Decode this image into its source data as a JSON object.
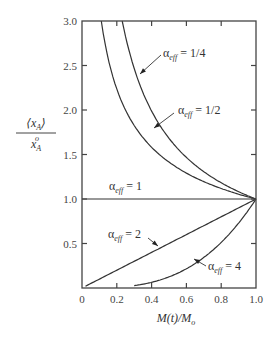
{
  "chart_data": {
    "type": "line",
    "title": "",
    "xlabel": "M(t)/M₀",
    "ylabel": "⟨x_A⟩ / x_A°",
    "xlim": [
      0,
      1.0
    ],
    "ylim": [
      0,
      3.0
    ],
    "grid": false,
    "legend": "inline annotations with arrows",
    "x_ticks": [
      "0",
      "0.2",
      "0.4",
      "0.6",
      "0.8",
      "1.0"
    ],
    "y_ticks": [
      "0.5",
      "1.0",
      "1.5",
      "2.0",
      "2.5",
      "3.0"
    ],
    "formula": "y = x^(alpha_eff - 1)",
    "series": [
      {
        "name": "α_eff = 1/4",
        "alpha": 0.25,
        "x": [
          0.231,
          0.3,
          0.4,
          0.5,
          0.6,
          0.7,
          0.8,
          0.9,
          1.0
        ],
        "y": [
          3.0,
          2.47,
          1.99,
          1.68,
          1.47,
          1.31,
          1.18,
          1.08,
          1.0
        ]
      },
      {
        "name": "α_eff = 1/2",
        "alpha": 0.5,
        "x": [
          0.111,
          0.2,
          0.3,
          0.4,
          0.5,
          0.6,
          0.7,
          0.8,
          0.9,
          1.0
        ],
        "y": [
          3.0,
          2.24,
          1.83,
          1.58,
          1.41,
          1.29,
          1.2,
          1.12,
          1.05,
          1.0
        ]
      },
      {
        "name": "α_eff = 1",
        "alpha": 1,
        "x": [
          0,
          1.0
        ],
        "y": [
          1.0,
          1.0
        ]
      },
      {
        "name": "α_eff = 2",
        "alpha": 2,
        "x": [
          0.02,
          0.2,
          0.4,
          0.6,
          0.8,
          1.0
        ],
        "y": [
          0.02,
          0.2,
          0.4,
          0.6,
          0.8,
          1.0
        ]
      },
      {
        "name": "α_eff = 4",
        "alpha": 4,
        "x": [
          0.3,
          0.4,
          0.5,
          0.6,
          0.7,
          0.8,
          0.9,
          1.0
        ],
        "y": [
          0.027,
          0.064,
          0.125,
          0.216,
          0.343,
          0.512,
          0.729,
          1.0
        ]
      }
    ],
    "annotations": [
      {
        "symbol": "α",
        "sub": "eff",
        "text": " = 1/4"
      },
      {
        "symbol": "α",
        "sub": "eff",
        "text": " = 1/2"
      },
      {
        "symbol": "α",
        "sub": "eff",
        "text": " = 1"
      },
      {
        "symbol": "α",
        "sub": "eff",
        "text": " = 2"
      },
      {
        "symbol": "α",
        "sub": "eff",
        "text": " = 4"
      }
    ],
    "ylabel_parts": {
      "numerator": "⟨x",
      "numerator_sub": "A",
      "numerator_close": "⟩",
      "denominator": "x",
      "denominator_sub": "A",
      "denominator_sup": "o"
    },
    "xlabel_parts": {
      "main": "M(t)/M",
      "sub": "o"
    }
  }
}
